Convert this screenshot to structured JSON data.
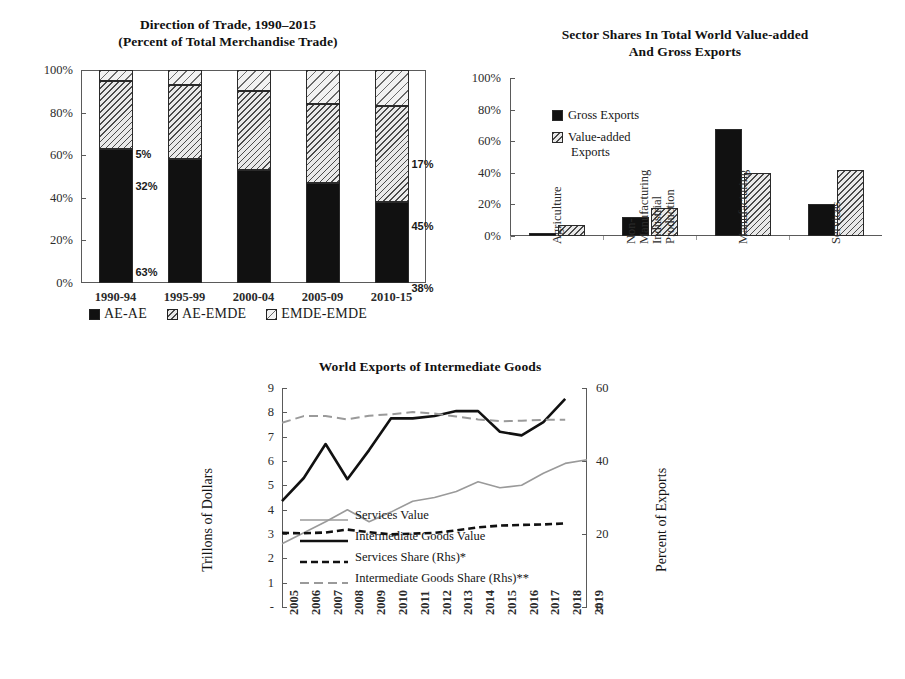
{
  "figure": {
    "caption_fragment": ""
  },
  "chart_data": [
    {
      "id": "direction-of-trade",
      "type": "bar",
      "stacked": true,
      "title": "Direction of Trade, 1990–2015",
      "subtitle": "(Percent of Total Merchandise Trade)",
      "xlabel": "",
      "ylabel": "",
      "ylim": [
        0,
        100
      ],
      "ytick_labels": [
        "0%",
        "20%",
        "40%",
        "60%",
        "80%",
        "100%"
      ],
      "yticks": [
        0,
        20,
        40,
        60,
        80,
        100
      ],
      "categories": [
        "1990-94",
        "1995-99",
        "2000-04",
        "2005-09",
        "2010-15"
      ],
      "series": [
        {
          "name": "AE-AE",
          "fill": "solid",
          "values": [
            63,
            58,
            53,
            47,
            38
          ]
        },
        {
          "name": "AE-EMDE",
          "fill": "hatch-mid",
          "values": [
            32,
            35,
            37,
            37,
            45
          ]
        },
        {
          "name": "EMDE-EMDE",
          "fill": "hatch-light",
          "values": [
            5,
            7,
            10,
            16,
            17
          ]
        }
      ],
      "data_labels": [
        {
          "text": "5%",
          "series": "EMDE-EMDE",
          "category": "1990-94"
        },
        {
          "text": "32%",
          "series": "AE-EMDE",
          "category": "1990-94"
        },
        {
          "text": "63%",
          "series": "AE-AE",
          "category": "1990-94"
        },
        {
          "text": "17%",
          "series": "EMDE-EMDE",
          "category": "2010-15"
        },
        {
          "text": "45%",
          "series": "AE-EMDE",
          "category": "2010-15"
        },
        {
          "text": "38%",
          "series": "AE-AE",
          "category": "2010-15"
        }
      ],
      "legend": {
        "position": "bottom",
        "entries": [
          "AE-AE",
          "AE-EMDE",
          "EMDE-EMDE"
        ]
      }
    },
    {
      "id": "sector-shares",
      "type": "bar",
      "stacked": false,
      "title_line1": "Sector Shares In Total World Value-added",
      "title_line2": "And Gross Exports",
      "xlabel": "",
      "ylabel": "",
      "ylim": [
        0,
        100
      ],
      "ytick_labels": [
        "0%",
        "20%",
        "40%",
        "60%",
        "80%",
        "100%"
      ],
      "yticks": [
        0,
        20,
        40,
        60,
        80,
        100
      ],
      "categories": [
        "Agriculture",
        "Non-Manufacturing Industrial Production",
        "Manufacturing",
        "Services"
      ],
      "category_label_lines": [
        [
          "Agriculture"
        ],
        [
          "Non-",
          "Manufacturing",
          "Industrial",
          "Production"
        ],
        [
          "Manufacturing"
        ],
        [
          "Services"
        ]
      ],
      "series": [
        {
          "name": "Gross Exports",
          "fill": "solid",
          "values": [
            2,
            12,
            68,
            20
          ]
        },
        {
          "name": "Value-added Exports",
          "fill": "hatch-mid",
          "values": [
            7,
            18,
            40,
            42
          ]
        }
      ],
      "legend": {
        "position": "inside-upper-left",
        "entries": [
          {
            "label": "Gross Exports",
            "fill": "solid"
          },
          {
            "label": "Value-added Exports",
            "fill": "hatch-mid",
            "wrap": [
              "Value-added",
              "Exports"
            ]
          }
        ]
      }
    },
    {
      "id": "world-exports-intermediate-goods",
      "type": "line",
      "title": "World Exports of Intermediate Goods",
      "xlabel": "",
      "ylabel": "Trillons of Dollars",
      "y2label": "Percent of Exports",
      "ylim": [
        0,
        9
      ],
      "y2lim": [
        0,
        60
      ],
      "ytick_labels": [
        "-",
        "1",
        "2",
        "3",
        "4",
        "5",
        "6",
        "7",
        "8",
        "9"
      ],
      "yticks": [
        0,
        1,
        2,
        3,
        4,
        5,
        6,
        7,
        8,
        9
      ],
      "y2tick_labels": [
        "0",
        "20",
        "40",
        "60"
      ],
      "y2ticks": [
        0,
        20,
        40,
        60
      ],
      "x": [
        "2005",
        "2006",
        "2007",
        "2008",
        "2009",
        "2010",
        "2011",
        "2012",
        "2013",
        "2014",
        "2015",
        "2016",
        "2017",
        "2018",
        "2019"
      ],
      "series": [
        {
          "name": "Services Value",
          "axis": "left",
          "style": "solid-gray",
          "values": [
            2.6,
            3.05,
            3.5,
            4.0,
            3.5,
            3.9,
            4.35,
            4.5,
            4.75,
            5.15,
            4.9,
            5.0,
            5.5,
            5.9,
            6.05
          ]
        },
        {
          "name": "Intermediate Goods Value",
          "axis": "left",
          "style": "solid-black-thick",
          "values": [
            4.35,
            5.3,
            6.7,
            5.25,
            6.45,
            7.75,
            7.75,
            7.85,
            8.05,
            8.05,
            7.2,
            7.05,
            7.6,
            8.55,
            null
          ]
        },
        {
          "name": "Services Share (Rhs)*",
          "axis": "right",
          "style": "dashed-black",
          "values": [
            20.3,
            20.2,
            20.4,
            21.2,
            20.5,
            19.9,
            20.1,
            20.3,
            21.0,
            21.8,
            22.3,
            22.5,
            22.6,
            22.9,
            null
          ]
        },
        {
          "name": "Intermediate Goods Share (Rhs)**",
          "axis": "right",
          "style": "dashed-gray",
          "values": [
            50.5,
            52.3,
            52.3,
            51.4,
            52.4,
            52.8,
            53.4,
            53.0,
            52.2,
            51.4,
            50.9,
            51.0,
            51.3,
            51.3,
            null
          ]
        }
      ],
      "legend": {
        "position": "inside-lower-left",
        "entries": [
          {
            "label": "Services Value",
            "style": "solid-gray"
          },
          {
            "label": "Intermediate Goods Value",
            "style": "solid-black-thick"
          },
          {
            "label": "Services Share (Rhs)*",
            "style": "dashed-black"
          },
          {
            "label": "Intermediate Goods Share (Rhs)**",
            "style": "dashed-gray"
          }
        ]
      }
    }
  ],
  "colors": {
    "solid": "#111111",
    "gray_line": "#9a9a9a",
    "black_line": "#111111",
    "axis": "#5a5a5a"
  }
}
